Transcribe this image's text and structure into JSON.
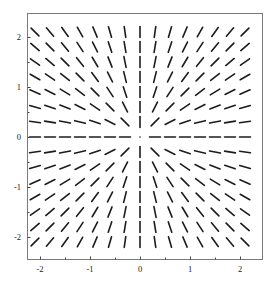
{
  "figure": {
    "title": "",
    "background_color": "#ffffff",
    "width": 278,
    "height": 283
  },
  "frame": {
    "left_px": 27,
    "top_px": 13,
    "right_px": 262,
    "bottom_px": 259,
    "border_color": "#7a7a7a",
    "border_width": 1
  },
  "axes": {
    "x_label": "",
    "y_label": "",
    "x_ticks": [
      "-2",
      "-1",
      "0",
      "1",
      "2"
    ],
    "x_tick_values": [
      -2,
      -1,
      0,
      1,
      2
    ],
    "y_ticks": [
      "2",
      "1",
      "0",
      "-1",
      "-2"
    ],
    "y_tick_values": [
      2,
      1,
      0,
      -1,
      -2
    ],
    "x_origin_px": 140,
    "y_origin_px": 137,
    "px_per_unit": 50,
    "tick_color": "#4a4a4a",
    "tick_length": 3
  },
  "chart_data": {
    "type": "scatter",
    "subtype": "direction-field",
    "title": "",
    "xlabel": "",
    "ylabel": "",
    "xlim": [
      -2.35,
      2.44
    ],
    "ylim": [
      -2.45,
      2.48
    ],
    "grid": false,
    "legend": null,
    "field": {
      "formula": "angle = atan2(y, x)",
      "segment_color": "#1c1c1c",
      "segment_width": 1.6,
      "segment_length_px": 11,
      "grid_nx": 15,
      "grid_ny": 15,
      "x_start": -2.1,
      "x_step": 0.3,
      "y_start": -2.1,
      "y_step": 0.3
    }
  }
}
